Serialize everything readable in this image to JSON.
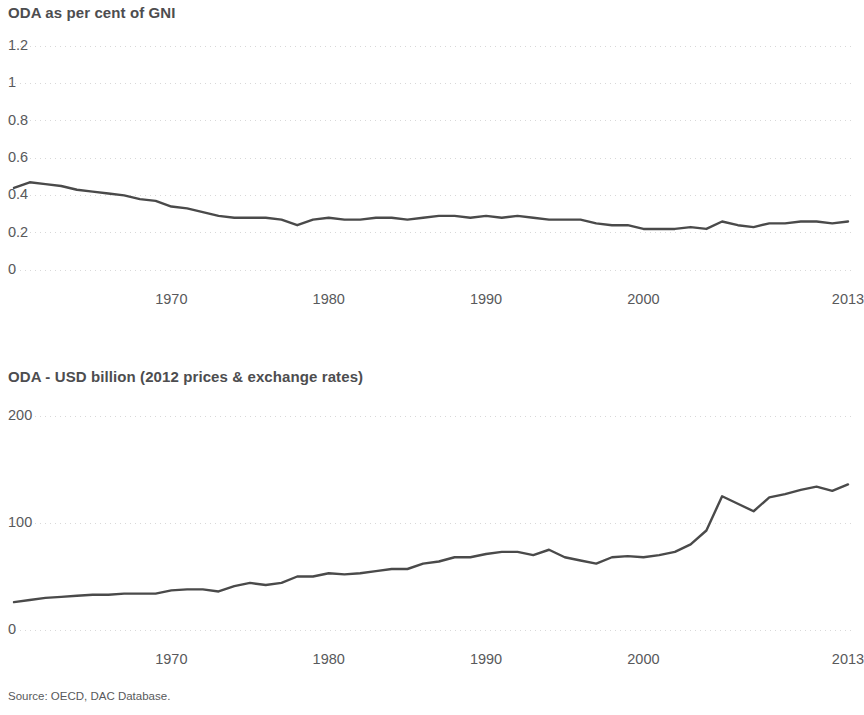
{
  "document": {
    "source_note": "Source: OECD, DAC Database."
  },
  "charts": [
    {
      "title": "ODA as per cent of GNI",
      "ytick_labels": [
        "1.2",
        "1",
        "0.8",
        "0.6",
        "0.4",
        "0.2",
        "0"
      ],
      "xtick_labels": [
        "1970",
        "1980",
        "1990",
        "2000",
        "2013"
      ]
    },
    {
      "title": "ODA - USD billion (2012 prices & exchange rates)",
      "ytick_labels": [
        "200",
        "100",
        "0"
      ],
      "xtick_labels": [
        "1970",
        "1980",
        "1990",
        "2000",
        "2013"
      ]
    }
  ],
  "chart_data": [
    {
      "type": "line",
      "title": "ODA as per cent of GNI",
      "xlabel": "",
      "ylabel": "",
      "ylim": [
        0,
        1.2
      ],
      "yticks": [
        0,
        0.2,
        0.4,
        0.6,
        0.8,
        1,
        1.2
      ],
      "xlim": [
        1960,
        2013
      ],
      "xticks": [
        1970,
        1980,
        1990,
        2000,
        2013
      ],
      "grid": "horizontal-dotted-faint",
      "legend": "none",
      "line_color": "#4a4a4a",
      "x": [
        1960,
        1961,
        1962,
        1963,
        1964,
        1965,
        1966,
        1967,
        1968,
        1969,
        1970,
        1971,
        1972,
        1973,
        1974,
        1975,
        1976,
        1977,
        1978,
        1979,
        1980,
        1981,
        1982,
        1983,
        1984,
        1985,
        1986,
        1987,
        1988,
        1989,
        1990,
        1991,
        1992,
        1993,
        1994,
        1995,
        1996,
        1997,
        1998,
        1999,
        2000,
        2001,
        2002,
        2003,
        2004,
        2005,
        2006,
        2007,
        2008,
        2009,
        2010,
        2011,
        2012,
        2013
      ],
      "values": [
        0.44,
        0.47,
        0.46,
        0.45,
        0.43,
        0.42,
        0.41,
        0.4,
        0.38,
        0.37,
        0.34,
        0.33,
        0.31,
        0.29,
        0.28,
        0.28,
        0.28,
        0.27,
        0.24,
        0.27,
        0.28,
        0.27,
        0.27,
        0.28,
        0.28,
        0.27,
        0.28,
        0.29,
        0.29,
        0.28,
        0.29,
        0.28,
        0.29,
        0.28,
        0.27,
        0.27,
        0.27,
        0.25,
        0.24,
        0.24,
        0.22,
        0.22,
        0.22,
        0.23,
        0.22,
        0.26,
        0.24,
        0.23,
        0.25,
        0.25,
        0.26,
        0.26,
        0.25,
        0.26
      ]
    },
    {
      "type": "line",
      "title": "ODA - USD billion (2012 prices & exchange rates)",
      "xlabel": "",
      "ylabel": "",
      "ylim": [
        0,
        200
      ],
      "yticks": [
        0,
        100,
        200
      ],
      "xlim": [
        1960,
        2013
      ],
      "xticks": [
        1970,
        1980,
        1990,
        2000,
        2013
      ],
      "grid": "horizontal-dotted-faint",
      "legend": "none",
      "line_color": "#4a4a4a",
      "x": [
        1960,
        1961,
        1962,
        1963,
        1964,
        1965,
        1966,
        1967,
        1968,
        1969,
        1970,
        1971,
        1972,
        1973,
        1974,
        1975,
        1976,
        1977,
        1978,
        1979,
        1980,
        1981,
        1982,
        1983,
        1984,
        1985,
        1986,
        1987,
        1988,
        1989,
        1990,
        1991,
        1992,
        1993,
        1994,
        1995,
        1996,
        1997,
        1998,
        1999,
        2000,
        2001,
        2002,
        2003,
        2004,
        2005,
        2006,
        2007,
        2008,
        2009,
        2010,
        2011,
        2012,
        2013
      ],
      "values": [
        26,
        28,
        30,
        31,
        32,
        33,
        33,
        34,
        34,
        34,
        37,
        38,
        38,
        36,
        41,
        44,
        42,
        44,
        50,
        50,
        53,
        52,
        53,
        55,
        57,
        57,
        62,
        64,
        68,
        68,
        71,
        73,
        73,
        70,
        75,
        68,
        65,
        62,
        68,
        69,
        68,
        70,
        73,
        80,
        93,
        125,
        118,
        111,
        124,
        127,
        131,
        134,
        130,
        136
      ]
    }
  ]
}
